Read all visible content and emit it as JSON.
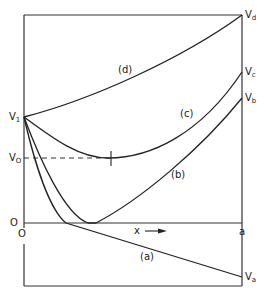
{
  "diagram": {
    "type": "potential-profile-curves",
    "axes": {
      "x_label": "x",
      "x_arrow": "→",
      "origin_label": "O",
      "origin_label_x": "O",
      "x_end_label": "a"
    },
    "levels": {
      "v1": {
        "main": "V",
        "sub": "1"
      },
      "v0": {
        "main": "V",
        "sub": "O"
      }
    },
    "curves": [
      {
        "id": "a",
        "label": "(a)",
        "end_label": {
          "main": "V",
          "sub": "a"
        }
      },
      {
        "id": "b",
        "label": "(b)",
        "end_label": {
          "main": "V",
          "sub": "b"
        }
      },
      {
        "id": "c",
        "label": "(c)",
        "end_label": {
          "main": "V",
          "sub": "c"
        }
      },
      {
        "id": "d",
        "label": "(d)",
        "end_label": {
          "main": "V",
          "sub": "d"
        }
      }
    ]
  }
}
